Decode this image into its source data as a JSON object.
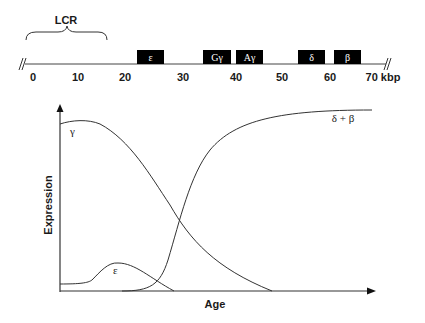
{
  "locus_map": {
    "lcr_label": "LCR",
    "unit_label": "kbp",
    "axis_ticks": [
      {
        "label": "0",
        "x": 33
      },
      {
        "label": "10",
        "x": 78
      },
      {
        "label": "20",
        "x": 125
      },
      {
        "label": "30",
        "x": 183
      },
      {
        "label": "40",
        "x": 236
      },
      {
        "label": "50",
        "x": 282
      },
      {
        "label": "60",
        "x": 330
      },
      {
        "label": "70 kbp",
        "x": 383
      }
    ],
    "genes": [
      {
        "name": "epsilon",
        "label": "ε",
        "x": 137,
        "w": 27
      },
      {
        "name": "g-gamma",
        "label": "Gγ",
        "x": 203,
        "w": 28
      },
      {
        "name": "a-gamma",
        "label": "Aγ",
        "x": 236,
        "w": 27
      },
      {
        "name": "delta",
        "label": "δ",
        "x": 298,
        "w": 27
      },
      {
        "name": "beta",
        "label": "β",
        "x": 334,
        "w": 27
      }
    ],
    "box_color": "#000000"
  },
  "chart": {
    "y_axis_label": "Expression",
    "x_axis_label": "Age",
    "curve_labels": {
      "gamma": "γ",
      "epsilon": "ε",
      "delta_beta": "δ + β"
    }
  },
  "chart_data": {
    "type": "line",
    "title": "",
    "xlabel": "Age",
    "ylabel": "Expression",
    "grid": false,
    "legend": "inline labels",
    "x": [
      0,
      10,
      20,
      30,
      40,
      50,
      60,
      70,
      80,
      90,
      100
    ],
    "series": [
      {
        "name": "γ",
        "values": [
          95,
          97,
          90,
          72,
          45,
          22,
          8,
          0,
          0,
          0,
          0
        ]
      },
      {
        "name": "ε",
        "values": [
          4,
          6,
          15,
          10,
          0,
          0,
          0,
          0,
          0,
          0,
          0
        ]
      },
      {
        "name": "δ + β",
        "values": [
          0,
          0,
          1,
          10,
          55,
          82,
          92,
          96,
          97,
          98,
          98
        ]
      }
    ],
    "ylim": [
      0,
      100
    ]
  }
}
